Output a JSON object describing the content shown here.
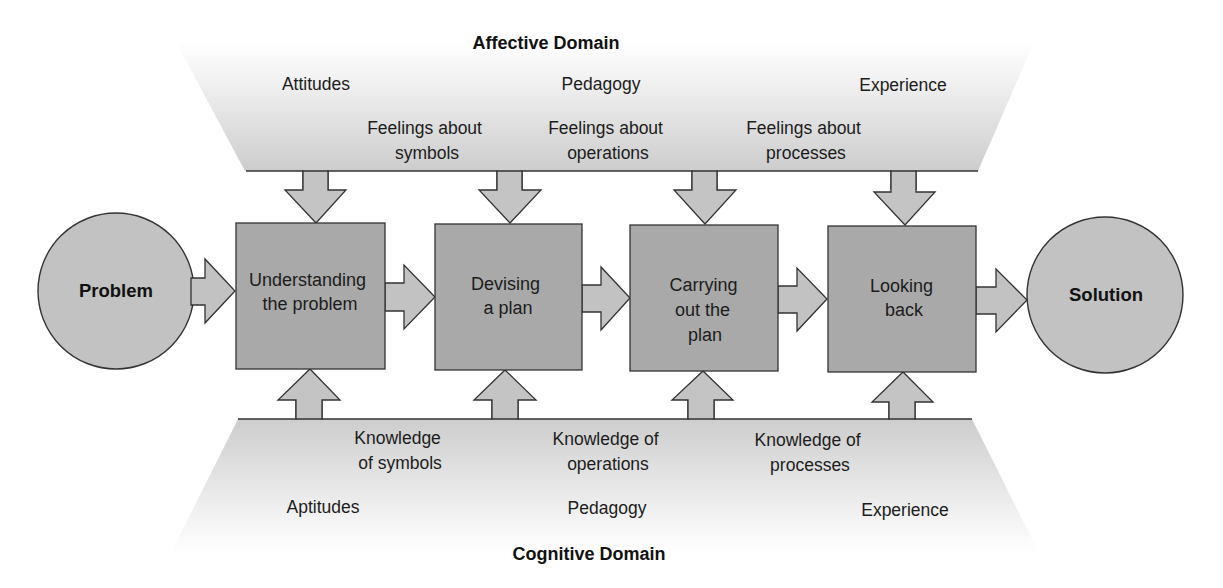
{
  "diagram": {
    "affective_domain": {
      "title": "Affective Domain",
      "influences": [
        "Attitudes",
        "Pedagogy",
        "Experience"
      ],
      "feelings": [
        [
          "Feelings about",
          "symbols"
        ],
        [
          "Feelings about",
          "operations"
        ],
        [
          "Feelings about",
          "processes"
        ]
      ]
    },
    "cognitive_domain": {
      "title": "Cognitive Domain",
      "influences": [
        "Aptitudes",
        "Pedagogy",
        "Experience"
      ],
      "knowledge": [
        [
          "Knowledge",
          "of symbols"
        ],
        [
          "Knowledge of",
          "operations"
        ],
        [
          "Knowledge of",
          "processes"
        ]
      ]
    },
    "start": "Problem",
    "end": "Solution",
    "steps": [
      [
        "Understanding",
        "the problem"
      ],
      [
        "Devising",
        "a plan"
      ],
      [
        "Carrying",
        "out the",
        "plan"
      ],
      [
        "Looking",
        "back"
      ]
    ],
    "colors": {
      "step_fill": "#a9a9a9",
      "terminal_fill": "#c2c2c2",
      "arrow_fill": "#c4c4c4",
      "band_shade": "#c9c9c9",
      "stroke": "#333333"
    }
  }
}
